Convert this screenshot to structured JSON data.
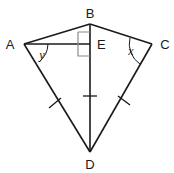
{
  "figure": {
    "background_color": "#ffffff",
    "stroke_color": "#1a1a1a",
    "right_angle_color": "#8a8a8a",
    "width": 174,
    "height": 173
  },
  "points": {
    "A": {
      "label": "A",
      "x": 24,
      "y": 44,
      "label_x": 10,
      "label_y": 48
    },
    "B": {
      "label": "B",
      "x": 90,
      "y": 24,
      "label_x": 86,
      "label_y": 18
    },
    "C": {
      "label": "C",
      "x": 152,
      "y": 44,
      "label_x": 159,
      "label_y": 48
    },
    "D": {
      "label": "D",
      "x": 90,
      "y": 152,
      "label_x": 86,
      "label_y": 168
    },
    "E": {
      "label": "E",
      "x": 90,
      "y": 44,
      "label_x": 95,
      "label_y": 49
    }
  },
  "segments": [
    {
      "name": "segment-AB",
      "from": "A",
      "to": "B"
    },
    {
      "name": "segment-BC",
      "from": "B",
      "to": "C"
    },
    {
      "name": "segment-AD",
      "from": "A",
      "to": "D"
    },
    {
      "name": "segment-CD",
      "from": "C",
      "to": "D"
    },
    {
      "name": "segment-BD",
      "from": "B",
      "to": "D"
    },
    {
      "name": "segment-AE",
      "from": "A",
      "to": "E"
    }
  ],
  "angles": [
    {
      "name": "angle-y-at-A",
      "label": "y",
      "vertex": "A",
      "label_x": 41,
      "label_y": 57
    },
    {
      "name": "angle-x-at-C",
      "label": "x",
      "vertex": "C",
      "label_x": 131,
      "label_y": 54
    }
  ],
  "right_angle": {
    "name": "right-angle-at-E",
    "vertex": "E",
    "size": 12,
    "description": "right angle marker between AE and ED"
  },
  "tick_marks": [
    {
      "name": "tick-on-AD",
      "segment": "AD",
      "count": 1,
      "x": 55,
      "y": 103
    },
    {
      "name": "tick-on-BD",
      "segment": "BD",
      "count": 1,
      "x": 90,
      "y": 96
    },
    {
      "name": "tick-on-CD",
      "segment": "CD",
      "count": 1,
      "x": 124,
      "y": 100
    }
  ]
}
